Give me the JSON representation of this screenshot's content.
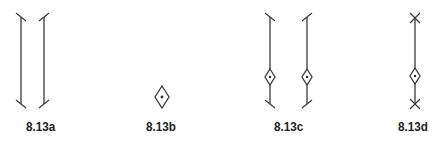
{
  "figure": {
    "panels": [
      {
        "id": "a",
        "label": "8.13a",
        "description": "two vertical dimension lines with slanted tick terminators"
      },
      {
        "id": "b",
        "label": "8.13b",
        "description": "diamond origin marker with center dot"
      },
      {
        "id": "c",
        "label": "8.13c",
        "description": "two vertical dimension lines with slanted ticks and diamond markers near bottom"
      },
      {
        "id": "d",
        "label": "8.13d",
        "description": "vertical dimension line with X terminators and diamond marker near bottom"
      }
    ],
    "colors": {
      "stroke": "#3a3a3a",
      "label": "#222222",
      "background": "#ffffff"
    }
  }
}
